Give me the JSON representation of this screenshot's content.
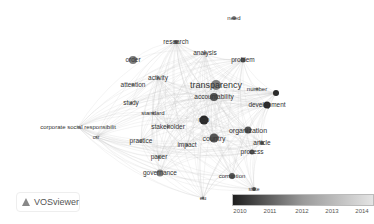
{
  "app": {
    "name": "VOSviewer"
  },
  "chart_data": {
    "type": "network",
    "title": "",
    "overlay_scale": {
      "min": 2010,
      "max": 2014,
      "ticks": [
        "2010",
        "2011",
        "2012",
        "2013",
        "2014"
      ]
    },
    "nodes": [
      {
        "label": "need",
        "x": 234,
        "y": 18,
        "size": 4,
        "year": 2012,
        "fs": 6
      },
      {
        "label": "research",
        "x": 176,
        "y": 42,
        "size": 4,
        "year": 2011,
        "fs": 6.5
      },
      {
        "label": "analysis",
        "x": 205,
        "y": 53,
        "size": 3,
        "year": 2012,
        "fs": 6.5
      },
      {
        "label": "order",
        "x": 133,
        "y": 60,
        "size": 8,
        "year": 2012,
        "fs": 6.5
      },
      {
        "label": "problem",
        "x": 243,
        "y": 60,
        "size": 5,
        "year": 2011,
        "fs": 6.5
      },
      {
        "label": "activity",
        "x": 158,
        "y": 78,
        "size": 3,
        "year": 2012,
        "fs": 6.5
      },
      {
        "label": "attention",
        "x": 133,
        "y": 85,
        "size": 3,
        "year": 2012,
        "fs": 6.5
      },
      {
        "label": "transparency",
        "x": 216,
        "y": 85,
        "size": 10,
        "year": 2012,
        "fs": 9
      },
      {
        "label": "accountability",
        "x": 214,
        "y": 97,
        "size": 8,
        "year": 2011,
        "fs": 6.5
      },
      {
        "label": "number",
        "x": 257,
        "y": 89,
        "size": 3,
        "year": 2012,
        "fs": 6
      },
      {
        "label": "ue",
        "x": 276,
        "y": 93,
        "size": 6,
        "year": 2010,
        "fs": 5
      },
      {
        "label": "development",
        "x": 267,
        "y": 105,
        "size": 7,
        "year": 2010,
        "fs": 6.5
      },
      {
        "label": "study",
        "x": 131,
        "y": 103,
        "size": 3,
        "year": 2012,
        "fs": 6.5
      },
      {
        "label": "standard",
        "x": 153,
        "y": 113,
        "size": 3,
        "year": 2012,
        "fs": 6
      },
      {
        "label": "ngo",
        "x": 204,
        "y": 120,
        "size": 9,
        "year": 2010,
        "fs": 6.5
      },
      {
        "label": "stakeholder",
        "x": 168,
        "y": 127,
        "size": 3,
        "year": 2012,
        "fs": 6.5
      },
      {
        "label": "corporate social responsibilit",
        "x": 78,
        "y": 127,
        "size": 2,
        "year": 2013,
        "fs": 6
      },
      {
        "label": "organization",
        "x": 248,
        "y": 130,
        "size": 7,
        "year": 2011,
        "fs": 7
      },
      {
        "label": "country",
        "x": 214,
        "y": 138,
        "size": 9,
        "year": 2011,
        "fs": 7
      },
      {
        "label": "csr",
        "x": 96,
        "y": 137,
        "size": 2,
        "year": 2013,
        "fs": 5
      },
      {
        "label": "practice",
        "x": 141,
        "y": 141,
        "size": 3,
        "year": 2012,
        "fs": 6.5
      },
      {
        "label": "impact",
        "x": 187,
        "y": 145,
        "size": 3,
        "year": 2012,
        "fs": 6.5
      },
      {
        "label": "article",
        "x": 262,
        "y": 143,
        "size": 4,
        "year": 2011,
        "fs": 6.5
      },
      {
        "label": "process",
        "x": 252,
        "y": 152,
        "size": 5,
        "year": 2011,
        "fs": 6.5
      },
      {
        "label": "paper",
        "x": 159,
        "y": 157,
        "size": 3,
        "year": 2012,
        "fs": 6.5
      },
      {
        "label": "governance",
        "x": 160,
        "y": 173,
        "size": 7,
        "year": 2012,
        "fs": 6.5
      },
      {
        "label": "corruption",
        "x": 232,
        "y": 176,
        "size": 6,
        "year": 2011,
        "fs": 6
      },
      {
        "label": "state",
        "x": 254,
        "y": 189,
        "size": 4,
        "year": 2011,
        "fs": 5
      },
      {
        "label": "eu",
        "x": 203,
        "y": 198,
        "size": 3,
        "year": 2012,
        "fs": 6
      }
    ]
  },
  "legend": {
    "ticks": [
      {
        "label": "2010",
        "pos": 8
      },
      {
        "label": "2011",
        "pos": 38
      },
      {
        "label": "2012",
        "pos": 70
      },
      {
        "label": "2013",
        "pos": 100
      },
      {
        "label": "2014",
        "pos": 130
      }
    ]
  }
}
